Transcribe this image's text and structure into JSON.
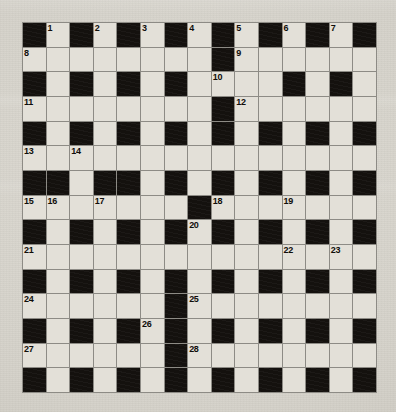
{
  "puzzle": {
    "type": "crossword-grid",
    "title": "",
    "rows": 15,
    "cols": 15,
    "cell_size_px": 23.6,
    "colors": {
      "paper": "#d6d3cb",
      "white_cell": "#e3e0d8",
      "black_cell": "#14110e",
      "grid_line": "#8d8b85",
      "number_text": "#100d0a"
    },
    "legend": {
      "black_symbol": "#",
      "white_symbol": "."
    },
    "grid": [
      "#.#.#.#.#.#.#.#",
      "........#......",
      "#.#.#.#....#.#.",
      "........#......",
      "#.#.#.#.#.#.#.#",
      "...............",
      "##.##.#.#.#.#.#",
      ".......#.......",
      "#.#.#.#.#.#.#.#",
      "...............",
      "#.#.#.#.#.#.#.#",
      "......#........",
      "#.#.#.#.#.#.#.#",
      "......#........",
      "#.#.#.#.#.#.#.#"
    ],
    "numbers": [
      {
        "n": "1",
        "row": 1,
        "col": 2
      },
      {
        "n": "2",
        "row": 1,
        "col": 4
      },
      {
        "n": "3",
        "row": 1,
        "col": 6
      },
      {
        "n": "4",
        "row": 1,
        "col": 8
      },
      {
        "n": "5",
        "row": 1,
        "col": 10
      },
      {
        "n": "6",
        "row": 1,
        "col": 12
      },
      {
        "n": "7",
        "row": 1,
        "col": 14
      },
      {
        "n": "8",
        "row": 2,
        "col": 1
      },
      {
        "n": "9",
        "row": 2,
        "col": 10
      },
      {
        "n": "10",
        "row": 3,
        "col": 9
      },
      {
        "n": "11",
        "row": 4,
        "col": 1
      },
      {
        "n": "12",
        "row": 4,
        "col": 10
      },
      {
        "n": "13",
        "row": 6,
        "col": 1
      },
      {
        "n": "14",
        "row": 6,
        "col": 3
      },
      {
        "n": "15",
        "row": 8,
        "col": 1
      },
      {
        "n": "16",
        "row": 8,
        "col": 2
      },
      {
        "n": "17",
        "row": 8,
        "col": 4
      },
      {
        "n": "18",
        "row": 8,
        "col": 9
      },
      {
        "n": "19",
        "row": 8,
        "col": 12
      },
      {
        "n": "20",
        "row": 9,
        "col": 8
      },
      {
        "n": "21",
        "row": 10,
        "col": 1
      },
      {
        "n": "22",
        "row": 10,
        "col": 12
      },
      {
        "n": "23",
        "row": 10,
        "col": 14
      },
      {
        "n": "24",
        "row": 12,
        "col": 1
      },
      {
        "n": "25",
        "row": 12,
        "col": 8
      },
      {
        "n": "26",
        "row": 13,
        "col": 6
      },
      {
        "n": "27",
        "row": 14,
        "col": 1
      },
      {
        "n": "28",
        "row": 14,
        "col": 8
      }
    ],
    "entries": []
  }
}
